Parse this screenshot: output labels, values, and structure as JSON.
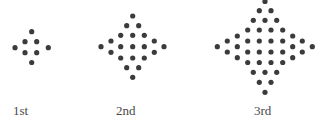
{
  "figures": [
    {
      "label": "1st",
      "label_x": 13,
      "dot_count": 8,
      "dots": [
        [
          31.7,
          31.7
        ],
        [
          25,
          41.7
        ],
        [
          36.7,
          41.7
        ],
        [
          15,
          47.7
        ],
        [
          48.3,
          47.7
        ],
        [
          25,
          52.7
        ],
        [
          36.7,
          52.7
        ],
        [
          31.7,
          62.5
        ]
      ]
    },
    {
      "label": "2nd",
      "label_x": 116,
      "dot_count": 24,
      "dots": [
        [
          132.7,
          16
        ],
        [
          126.7,
          25.7
        ],
        [
          138.7,
          25.7
        ],
        [
          120.7,
          35.3
        ],
        [
          132.7,
          35.3
        ],
        [
          144.3,
          35.3
        ],
        [
          111,
          41
        ],
        [
          154.3,
          41
        ],
        [
          101,
          46.7
        ],
        [
          120.7,
          46.7
        ],
        [
          132.7,
          46.7
        ],
        [
          144.3,
          46.7
        ],
        [
          164,
          46.7
        ],
        [
          111,
          52.3
        ],
        [
          154.3,
          52.3
        ],
        [
          120.7,
          58
        ],
        [
          132.7,
          58
        ],
        [
          144.3,
          58
        ],
        [
          126.7,
          67.7
        ],
        [
          138.7,
          67.7
        ],
        [
          132.7,
          77.3
        ]
      ]
    },
    {
      "label": "3rd",
      "label_x": 254,
      "dots": [
        [
          265,
          1.5
        ],
        [
          259.3,
          10.7
        ],
        [
          271,
          10.7
        ],
        [
          253.3,
          20.3
        ],
        [
          265,
          20.3
        ],
        [
          276.7,
          20.3
        ],
        [
          247.7,
          30
        ],
        [
          259.3,
          30
        ],
        [
          271,
          30
        ],
        [
          282.7,
          30
        ],
        [
          237.3,
          36
        ],
        [
          292.7,
          36
        ],
        [
          227.3,
          41
        ],
        [
          247.7,
          41
        ],
        [
          259.3,
          41
        ],
        [
          271,
          41
        ],
        [
          282.7,
          41
        ],
        [
          302.3,
          41
        ],
        [
          217.3,
          46.7
        ],
        [
          237.3,
          46.7
        ],
        [
          292.7,
          46.7
        ],
        [
          312.3,
          46.7
        ],
        [
          227.3,
          52
        ],
        [
          247.7,
          52
        ],
        [
          259.3,
          52
        ],
        [
          271,
          52
        ],
        [
          282.7,
          52
        ],
        [
          302.3,
          52
        ],
        [
          237.3,
          57.7
        ],
        [
          292.7,
          57.7
        ],
        [
          247.7,
          62.5
        ],
        [
          259.3,
          62.5
        ],
        [
          271,
          62.5
        ],
        [
          282.7,
          62.5
        ],
        [
          253.3,
          72.3
        ],
        [
          265,
          72.3
        ],
        [
          276.7,
          72.3
        ],
        [
          259.3,
          82.3
        ],
        [
          271,
          82.3
        ],
        [
          265,
          92.3
        ]
      ]
    }
  ],
  "style": {
    "dot_color": "#3b3b3b",
    "dot_radius": 2.6,
    "label_color": "#4a4a4a"
  }
}
